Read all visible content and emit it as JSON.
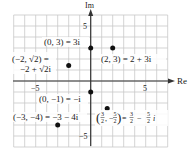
{
  "axes": {
    "x_label": "Re",
    "y_label": "Im",
    "x_range": [
      -7,
      7
    ],
    "y_range": [
      -6,
      6
    ],
    "x_ticks": [
      {
        "value": -5,
        "label": "−5"
      },
      {
        "value": 5,
        "label": "5"
      }
    ],
    "y_ticks": [
      {
        "value": 5,
        "label": "5"
      },
      {
        "value": -5,
        "label": "−5"
      }
    ],
    "grid": true
  },
  "points": [
    {
      "x": 0,
      "y": 3,
      "label": "(0, 3) = 3i"
    },
    {
      "x": 2,
      "y": 3,
      "label": "(2, 3) = 2 + 3i"
    },
    {
      "x": -2,
      "y": 1.414,
      "label_line1": "(−2, √2) =",
      "label_line2": "−2 + √2i"
    },
    {
      "x": 0,
      "y": -1,
      "label": "(0, −1) = −i"
    },
    {
      "x": -3,
      "y": -4,
      "label": "(−3, −4) = −3 − 4i"
    },
    {
      "x": 1.5,
      "y": -2.5,
      "label": "(3/2, −5/2) = 3/2 − 5/2 i"
    }
  ],
  "colors": {
    "grid": "#c8c8c8",
    "axis": "#333333",
    "point": "#111111"
  }
}
